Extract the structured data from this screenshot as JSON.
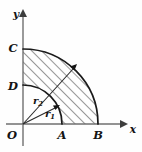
{
  "figure": {
    "background_color": "#fefefe",
    "curve_color": "#1a1a1a",
    "axis_color": "#6f6f6f",
    "hatch_color": "#3a3a3a",
    "axes": {
      "x_label": "x",
      "y_label": "y",
      "origin_label": "O"
    },
    "points": [
      {
        "id": "O",
        "label": "O",
        "on": "origin",
        "x": 23,
        "y": 124
      },
      {
        "id": "A",
        "label": "A",
        "on": "x-axis",
        "x": 62,
        "y": 124
      },
      {
        "id": "B",
        "label": "B",
        "on": "x-axis",
        "x": 98,
        "y": 124
      },
      {
        "id": "C",
        "label": "C",
        "on": "y-axis",
        "x": 23,
        "y": 50
      },
      {
        "id": "D",
        "label": "D",
        "on": "y-axis",
        "x": 23,
        "y": 87
      }
    ],
    "radii": [
      {
        "id": "r1",
        "label": "r",
        "subscript": "1",
        "role": "inner-radius",
        "endpoints": "O to inner arc",
        "length_px": 39
      },
      {
        "id": "r2",
        "label": "r",
        "subscript": "2",
        "role": "outer-radius",
        "endpoints": "O to outer arc",
        "length_px": 75
      }
    ],
    "arcs": [
      {
        "id": "inner-arc",
        "from": "D",
        "to": "A",
        "radius_px": 39,
        "quadrant": "first"
      },
      {
        "id": "outer-arc",
        "from": "C",
        "to": "B",
        "radius_px": 75,
        "quadrant": "first"
      }
    ],
    "shaded_region": {
      "description": "quarter annulus between inner arc DA and outer arc CB",
      "fill": "diagonal-hatch",
      "hatch_angle_deg": 45
    }
  }
}
